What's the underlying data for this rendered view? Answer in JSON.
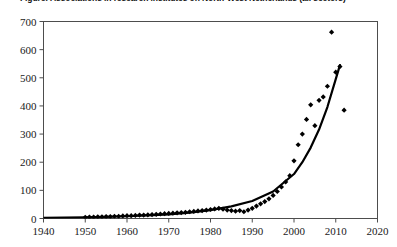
{
  "figure": {
    "title": "Figure: Associations in research institutes on North-West Netherlands (all sectors)",
    "title_cropped": true
  },
  "chart_data": {
    "type": "scatter",
    "title": "Figure: Associations in research institutes on North-West Netherlands (all sectors)",
    "xlabel": "",
    "ylabel": "",
    "xlim": [
      1940,
      2020
    ],
    "ylim": [
      0,
      700
    ],
    "xticks": [
      1940,
      1950,
      1960,
      1970,
      1980,
      1990,
      2000,
      2010,
      2020
    ],
    "xticklabels": [
      "1940",
      "1950",
      "1960",
      "1970",
      "1980",
      "1990",
      "2000",
      "2010",
      "2020"
    ],
    "yticks": [
      0,
      100,
      200,
      300,
      400,
      500,
      600,
      700
    ],
    "yticklabels": [
      "0",
      "100",
      "200",
      "300",
      "400",
      "500",
      "600",
      "700"
    ],
    "grid": false,
    "legend": false,
    "marker": "diamond",
    "marker_color": "#000000",
    "marker_size": 2.6,
    "series": [
      {
        "name": "observations",
        "type": "scatter",
        "x": [
          1950,
          1951,
          1952,
          1953,
          1954,
          1955,
          1956,
          1957,
          1958,
          1959,
          1960,
          1961,
          1962,
          1963,
          1964,
          1965,
          1966,
          1967,
          1968,
          1969,
          1970,
          1971,
          1972,
          1973,
          1974,
          1975,
          1976,
          1977,
          1978,
          1979,
          1980,
          1981,
          1982,
          1983,
          1984,
          1985,
          1986,
          1987,
          1988,
          1989,
          1990,
          1991,
          1992,
          1993,
          1994,
          1995,
          1996,
          1997,
          1998,
          1999,
          2000,
          2001,
          2002,
          2003,
          2004,
          2005,
          2006,
          2007,
          2008,
          2009,
          2010,
          2011,
          2012
        ],
        "y": [
          4,
          5,
          5,
          6,
          6,
          7,
          7,
          8,
          8,
          9,
          10,
          10,
          11,
          12,
          12,
          13,
          14,
          15,
          16,
          17,
          18,
          19,
          20,
          21,
          22,
          24,
          25,
          27,
          28,
          30,
          32,
          34,
          36,
          33,
          30,
          28,
          26,
          28,
          24,
          30,
          36,
          44,
          52,
          60,
          70,
          82,
          96,
          112,
          130,
          152,
          205,
          262,
          300,
          352,
          404,
          330,
          420,
          432,
          470,
          662,
          520,
          540,
          385
        ]
      },
      {
        "name": "exponential fit",
        "type": "line",
        "color": "#000000",
        "width": 2.2,
        "x": [
          1940,
          1945,
          1950,
          1955,
          1960,
          1965,
          1970,
          1975,
          1980,
          1985,
          1990,
          1995,
          2000,
          2002,
          2004,
          2006,
          2008,
          2010,
          2011
        ],
        "y": [
          2,
          3,
          4,
          6,
          8,
          11,
          15,
          21,
          30,
          43,
          62,
          96,
          158,
          200,
          252,
          316,
          396,
          495,
          545
        ]
      }
    ]
  }
}
